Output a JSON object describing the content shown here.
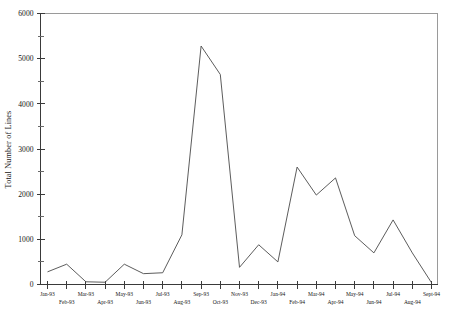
{
  "chart_data": {
    "type": "line",
    "title": "",
    "xlabel": "",
    "ylabel": "Total Number of Lines",
    "ylim": [
      0,
      6000
    ],
    "grid": false,
    "legend": false,
    "y_ticks_major": [
      0,
      1000,
      2000,
      3000,
      4000,
      5000,
      6000
    ],
    "y_tick_labels": [
      "0",
      "1000",
      "2000",
      "3000",
      "4000",
      "5000",
      "6000"
    ],
    "y_ticks_minor": [
      500,
      1500,
      2500,
      3500,
      4500,
      5500
    ],
    "categories": [
      "Jan-93",
      "Feb-93",
      "Mar-93",
      "Apr-93",
      "May-93",
      "Jun-93",
      "Jul-93",
      "Aug-93",
      "Sep-93",
      "Oct-93",
      "Nov-93",
      "Dec-93",
      "Jan-94",
      "Feb-94",
      "Mar-94",
      "Apr-94",
      "May-94",
      "Jun-94",
      "Jul-94",
      "Aug-94",
      "Sept-94"
    ],
    "values": [
      280,
      450,
      60,
      50,
      450,
      240,
      260,
      1100,
      5280,
      4650,
      380,
      880,
      500,
      2600,
      1980,
      2360,
      1080,
      700,
      1430,
      700,
      40
    ],
    "series": [
      {
        "name": "Total Number of Lines",
        "values": [
          280,
          450,
          60,
          50,
          450,
          240,
          260,
          1100,
          5280,
          4650,
          380,
          880,
          500,
          2600,
          1980,
          2360,
          1080,
          700,
          1430,
          700,
          40
        ]
      }
    ]
  },
  "axes": {
    "y_title": "Total Number of Lines"
  },
  "colors": {
    "line": "#4a4a4a",
    "axis": "#3a3a3a",
    "frame": "#9a9a9a",
    "background": "#ffffff",
    "text": "#141414"
  }
}
